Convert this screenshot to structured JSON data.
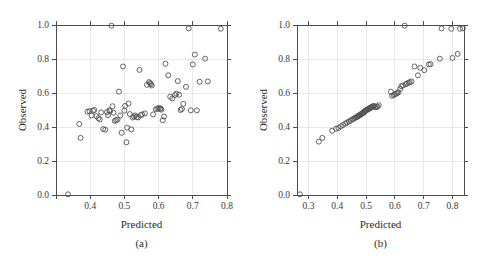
{
  "figure": {
    "background": "#ffffff",
    "point_color": "#535353",
    "axis_color": "#4c4c4c",
    "grid_color": "#e8e8e8"
  },
  "panels": [
    {
      "caption": "(a)",
      "xlabel": "Predicted",
      "ylabel": "Observed"
    },
    {
      "caption": "(b)",
      "xlabel": "Predicted",
      "ylabel": "Observed"
    }
  ],
  "chart_data": [
    {
      "type": "scatter",
      "title": "(a)",
      "xlabel": "Predicted",
      "ylabel": "Observed",
      "xlim": [
        0.3,
        0.8
      ],
      "ylim": [
        0.0,
        1.0
      ],
      "xticks": [
        0.3,
        0.4,
        0.5,
        0.6,
        0.7,
        0.8
      ],
      "xticklabels": [
        "",
        "0.4",
        "0.5",
        "0.6",
        "0.7",
        "0.8"
      ],
      "yticks": [
        0.0,
        0.2,
        0.4,
        0.6,
        0.8,
        1.0
      ],
      "yticklabels": [
        "0.0",
        "0.2",
        "0.4",
        "0.6",
        "0.8",
        "1.0"
      ],
      "grid": true,
      "legend": null,
      "marker": "open-circle",
      "x": [
        0.335,
        0.368,
        0.372,
        0.392,
        0.398,
        0.404,
        0.408,
        0.412,
        0.418,
        0.424,
        0.428,
        0.432,
        0.438,
        0.444,
        0.449,
        0.452,
        0.456,
        0.458,
        0.462,
        0.465,
        0.468,
        0.472,
        0.476,
        0.48,
        0.484,
        0.488,
        0.492,
        0.496,
        0.5,
        0.502,
        0.506,
        0.508,
        0.512,
        0.516,
        0.52,
        0.524,
        0.528,
        0.532,
        0.536,
        0.54,
        0.544,
        0.548,
        0.552,
        0.56,
        0.566,
        0.572,
        0.575,
        0.578,
        0.58,
        0.584,
        0.592,
        0.596,
        0.6,
        0.604,
        0.606,
        0.608,
        0.612,
        0.616,
        0.62,
        0.628,
        0.634,
        0.64,
        0.648,
        0.652,
        0.656,
        0.66,
        0.664,
        0.668,
        0.672,
        0.68,
        0.688,
        0.694,
        0.7,
        0.706,
        0.712,
        0.72,
        0.736,
        0.744,
        0.782
      ],
      "y": [
        0.004,
        0.418,
        0.336,
        0.49,
        0.494,
        0.468,
        0.496,
        0.5,
        0.464,
        0.452,
        0.444,
        0.486,
        0.388,
        0.384,
        0.488,
        0.47,
        0.498,
        0.494,
        0.996,
        0.522,
        0.484,
        0.436,
        0.44,
        0.444,
        0.608,
        0.468,
        0.366,
        0.756,
        0.496,
        0.524,
        0.31,
        0.396,
        0.538,
        0.476,
        0.386,
        0.456,
        0.462,
        0.468,
        0.458,
        0.456,
        0.736,
        0.47,
        0.474,
        0.48,
        0.648,
        0.664,
        0.658,
        0.652,
        0.644,
        0.474,
        0.504,
        0.508,
        0.512,
        0.506,
        0.51,
        0.502,
        0.44,
        0.462,
        0.772,
        0.704,
        0.578,
        0.568,
        0.588,
        0.596,
        0.67,
        0.59,
        0.5,
        0.506,
        0.536,
        0.636,
        0.98,
        0.498,
        0.768,
        0.826,
        0.498,
        0.666,
        0.802,
        0.668,
        0.978
      ]
    },
    {
      "type": "scatter",
      "title": "(b)",
      "xlabel": "Predicted",
      "ylabel": "Observed",
      "xlim": [
        0.26,
        0.84
      ],
      "ylim": [
        0.0,
        1.0
      ],
      "xticks": [
        0.3,
        0.4,
        0.5,
        0.6,
        0.7,
        0.8
      ],
      "xticklabels": [
        "0.3",
        "0.4",
        "0.5",
        "0.6",
        "0.7",
        "0.8"
      ],
      "yticks": [
        0.0,
        0.2,
        0.4,
        0.6,
        0.8,
        1.0
      ],
      "yticklabels": [
        "0.0",
        "0.2",
        "0.4",
        "0.6",
        "0.8",
        "1.0"
      ],
      "grid": true,
      "legend": null,
      "marker": "open-circle",
      "x": [
        0.27,
        0.336,
        0.348,
        0.382,
        0.396,
        0.404,
        0.412,
        0.42,
        0.428,
        0.434,
        0.44,
        0.446,
        0.452,
        0.456,
        0.46,
        0.464,
        0.468,
        0.47,
        0.472,
        0.474,
        0.476,
        0.478,
        0.48,
        0.482,
        0.484,
        0.486,
        0.488,
        0.49,
        0.492,
        0.494,
        0.496,
        0.498,
        0.5,
        0.502,
        0.504,
        0.506,
        0.508,
        0.51,
        0.512,
        0.514,
        0.516,
        0.518,
        0.52,
        0.522,
        0.524,
        0.528,
        0.532,
        0.536,
        0.54,
        0.544,
        0.586,
        0.59,
        0.596,
        0.6,
        0.604,
        0.608,
        0.612,
        0.618,
        0.622,
        0.628,
        0.634,
        0.638,
        0.642,
        0.648,
        0.652,
        0.658,
        0.668,
        0.68,
        0.688,
        0.702,
        0.718,
        0.724,
        0.756,
        0.762,
        0.796,
        0.8,
        0.818,
        0.826,
        0.836
      ],
      "y": [
        0.004,
        0.314,
        0.336,
        0.378,
        0.39,
        0.394,
        0.404,
        0.412,
        0.42,
        0.426,
        0.432,
        0.438,
        0.444,
        0.448,
        0.452,
        0.456,
        0.458,
        0.462,
        0.464,
        0.466,
        0.468,
        0.47,
        0.472,
        0.474,
        0.478,
        0.48,
        0.482,
        0.484,
        0.486,
        0.49,
        0.494,
        0.496,
        0.498,
        0.5,
        0.502,
        0.504,
        0.506,
        0.508,
        0.51,
        0.512,
        0.514,
        0.516,
        0.518,
        0.52,
        0.522,
        0.524,
        0.516,
        0.518,
        0.52,
        0.528,
        0.608,
        0.584,
        0.588,
        0.592,
        0.596,
        0.6,
        0.604,
        0.624,
        0.64,
        0.644,
        0.996,
        0.652,
        0.656,
        0.66,
        0.664,
        0.668,
        0.756,
        0.704,
        0.748,
        0.734,
        0.768,
        0.77,
        0.802,
        0.98,
        0.978,
        0.806,
        0.83,
        0.978,
        0.98
      ]
    }
  ]
}
